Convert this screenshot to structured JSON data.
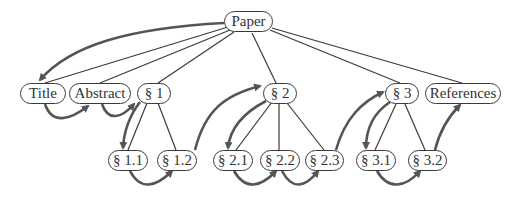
{
  "diagram": {
    "type": "tree-with-traversal",
    "colors": {
      "edge": "#3a3a3a",
      "traversal_arrow": "#555555",
      "node_border": "#3a3a3a",
      "text": "#333333"
    },
    "nodes": [
      {
        "id": "paper",
        "label": "Paper",
        "x": 224,
        "y": 11,
        "w": 49
      },
      {
        "id": "title",
        "label": "Title",
        "x": 20,
        "y": 83,
        "w": 46
      },
      {
        "id": "abstract",
        "label": "Abstract",
        "x": 69,
        "y": 83,
        "w": 62
      },
      {
        "id": "s1",
        "label": "§ 1",
        "x": 137,
        "y": 83,
        "w": 34
      },
      {
        "id": "s2",
        "label": "§ 2",
        "x": 263,
        "y": 83,
        "w": 34
      },
      {
        "id": "s3",
        "label": "§ 3",
        "x": 385,
        "y": 83,
        "w": 34
      },
      {
        "id": "references",
        "label": "References",
        "x": 425,
        "y": 83,
        "w": 76
      },
      {
        "id": "s1_1",
        "label": "§ 1.1",
        "x": 108,
        "y": 150,
        "w": 40
      },
      {
        "id": "s1_2",
        "label": "§ 1.2",
        "x": 157,
        "y": 150,
        "w": 40
      },
      {
        "id": "s2_1",
        "label": "§ 2.1",
        "x": 213,
        "y": 150,
        "w": 40
      },
      {
        "id": "s2_2",
        "label": "§ 2.2",
        "x": 260,
        "y": 150,
        "w": 40
      },
      {
        "id": "s2_3",
        "label": "§ 2.3",
        "x": 305,
        "y": 150,
        "w": 39
      },
      {
        "id": "s3_1",
        "label": "§ 3.1",
        "x": 356,
        "y": 150,
        "w": 40
      },
      {
        "id": "s3_2",
        "label": "§ 3.2",
        "x": 408,
        "y": 150,
        "w": 39
      }
    ],
    "tree_edges": [
      [
        "paper",
        "title"
      ],
      [
        "paper",
        "abstract"
      ],
      [
        "paper",
        "s1"
      ],
      [
        "paper",
        "s2"
      ],
      [
        "paper",
        "s3"
      ],
      [
        "paper",
        "references"
      ],
      [
        "s1",
        "s1_1"
      ],
      [
        "s1",
        "s1_2"
      ],
      [
        "s2",
        "s2_1"
      ],
      [
        "s2",
        "s2_2"
      ],
      [
        "s2",
        "s2_3"
      ],
      [
        "s3",
        "s3_1"
      ],
      [
        "s3",
        "s3_2"
      ]
    ],
    "traversal_order": [
      "paper",
      "title",
      "abstract",
      "s1",
      "s1_1",
      "s1_2",
      "s2",
      "s2_1",
      "s2_2",
      "s2_3",
      "s3",
      "s3_1",
      "s3_2",
      "references"
    ]
  }
}
